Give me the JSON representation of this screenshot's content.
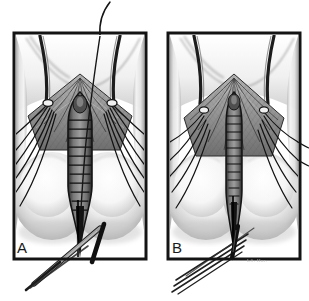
{
  "figure": {
    "medium": "pen-and-ink / airbrush halftone medical illustration",
    "background_color": "#ffffff",
    "ink_color": "#1a1a1a",
    "panel_count": 2,
    "width_px": 309,
    "height_px": 301
  },
  "panels": [
    {
      "id": "panel-a",
      "letter": "A",
      "letter_position": "bottom-left inside frame",
      "frame": {
        "x": 14,
        "y": 33,
        "width": 132,
        "height": 226,
        "border_color": "#141414",
        "border_width_px": 3
      },
      "caption": "",
      "features": {
        "stage": "wound edges retracted open; deep layer exposed",
        "suture_count_left": 6,
        "suture_count_right": 6,
        "has_free_needle_thread_above_frame": true,
        "instrument": "needle holder / forceps crossing lower frame edge",
        "instrument_angle_deg": -36,
        "midline_structure": "open ladder-like incision with transverse rungs",
        "rung_count": 11
      }
    },
    {
      "id": "panel-b",
      "letter": "B",
      "letter_position": "bottom-left inside frame",
      "frame": {
        "x": 168,
        "y": 33,
        "width": 132,
        "height": 226,
        "border_color": "#141414",
        "border_width_px": 3
      },
      "caption": "",
      "features": {
        "stage": "tissue approximated; sutures drawn together narrowing midline",
        "suture_count_left": 5,
        "suture_count_right": 5,
        "has_free_needle_thread_above_frame": false,
        "instrument": "bundle of parallel suture strands exiting lower-left",
        "strand_count": 4,
        "midline_structure": "narrowed closed ladder-like midline",
        "rung_count": 12
      }
    }
  ],
  "labels": {
    "panel_a_letter": "A",
    "panel_b_letter": "B",
    "artist_credit": "LS. Hur."
  },
  "palette": {
    "ink": "#1a1a1a",
    "frame": "#141414",
    "mid_gray": "#8d8d8d",
    "light_gray": "#d8d8d8",
    "pale_gray": "#efefef",
    "shadow": "#5a5a5a",
    "paper": "#ffffff"
  }
}
